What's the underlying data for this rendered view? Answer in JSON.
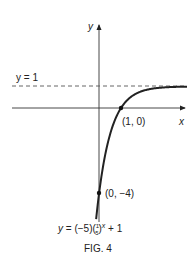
{
  "chart_data": {
    "type": "line",
    "title": "FIG. 4",
    "equation": "y = (−5)(1/5)^x + 1",
    "equation_parts": {
      "lhs": "y = (−5)(",
      "num": "1",
      "den": "5",
      "rhs": ")",
      "exp": "x",
      "tail": " + 1"
    },
    "xlabel": "x",
    "ylabel": "y",
    "asymptote": {
      "label": "y = 1",
      "y": 1,
      "style": "dashed"
    },
    "points": [
      {
        "x": 1,
        "y": 0,
        "label": "(1, 0)"
      },
      {
        "x": 0,
        "y": -4,
        "label": "(0, -4)"
      }
    ],
    "series": [
      {
        "name": "y = (-5)(1/5)^x + 1",
        "function": "-5*(0.2)^x + 1",
        "x_range": [
          -0.13,
          4
        ]
      }
    ],
    "grid": false,
    "legend": "none"
  },
  "labels": {
    "y_axis": "y",
    "x_axis": "x",
    "asymptote": "y = 1",
    "point_a": "(1, 0)",
    "point_b": "(0, −4)",
    "fig": "FIG. 4"
  }
}
